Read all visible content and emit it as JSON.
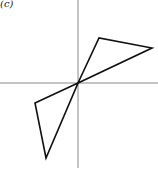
{
  "figure": {
    "label": "(c)",
    "axes": {
      "origin": [
        78,
        83
      ],
      "horizontal": {
        "x1": 0,
        "x2": 158,
        "y": 83
      },
      "vertical": {
        "x": 78,
        "y1": 0,
        "y2": 168
      },
      "color": "#8a8a8a"
    },
    "shapes": [
      {
        "name": "upper-right-triangle",
        "points": [
          [
            78,
            83
          ],
          [
            99,
            38
          ],
          [
            152,
            48
          ]
        ]
      },
      {
        "name": "lower-left-triangle",
        "points": [
          [
            78,
            83
          ],
          [
            35,
            103
          ],
          [
            46,
            158
          ]
        ]
      }
    ],
    "stroke_color": "#111111"
  }
}
